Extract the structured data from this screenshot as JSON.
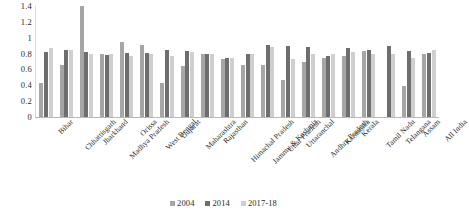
{
  "chart_data": {
    "type": "bar",
    "title": "",
    "subtitle": "",
    "xlabel": "",
    "ylabel": "",
    "ylim": [
      0,
      1.4
    ],
    "ytick_step": 0.2,
    "yticks": [
      "1.4",
      "1.2",
      "1",
      "0.8",
      "0.6",
      "0.4",
      "0.2",
      "0"
    ],
    "ytick_values": [
      1.4,
      1.2,
      1.0,
      0.8,
      0.6,
      0.4,
      0.2,
      0
    ],
    "grid": false,
    "legend_position": "bottom",
    "categories": [
      "Bihar",
      "Chhattisgarh",
      "Jharkhand",
      "Madhya Pradesh",
      "Orissa",
      "West Bengal",
      "Gujarat",
      "Maharashtra",
      "Rajasthan",
      "Himachal Pradesh",
      "Jammu & Kashmir",
      "Uttar Pradesh",
      "Uttaranchal",
      "Andhra Pradesh",
      "Karnataka",
      "Kerala",
      "Tamil Nadu",
      "Telangana",
      "Assam",
      "All India"
    ],
    "series": [
      {
        "name": "2004",
        "color": "#a6a6a6",
        "values": [
          0.43,
          0.66,
          1.4,
          0.79,
          0.94,
          0.91,
          0.43,
          0.64,
          0.8,
          0.73,
          0.66,
          0.65,
          0.47,
          0.7,
          0.75,
          0.77,
          0.83,
          null,
          0.39,
          0.8
        ]
      },
      {
        "name": "2014",
        "color": "#6e6e6e",
        "values": [
          0.82,
          0.85,
          0.82,
          0.78,
          0.81,
          0.81,
          0.84,
          0.83,
          0.8,
          0.74,
          0.8,
          0.91,
          0.89,
          0.88,
          0.77,
          0.87,
          0.84,
          0.89,
          0.83,
          0.81
        ]
      },
      {
        "name": "2017-18",
        "color": "#cfcfcf",
        "values": [
          0.87,
          0.84,
          0.8,
          0.8,
          0.77,
          0.79,
          0.77,
          0.82,
          0.8,
          0.75,
          0.8,
          0.88,
          0.73,
          0.79,
          0.8,
          0.82,
          0.79,
          0.8,
          0.75,
          0.85
        ]
      }
    ]
  },
  "legend": {
    "items": [
      {
        "label": "2004",
        "color": "#a6a6a6"
      },
      {
        "label": "2014",
        "color": "#6e6e6e"
      },
      {
        "label": "2017-18",
        "color": "#cfcfcf"
      }
    ]
  }
}
